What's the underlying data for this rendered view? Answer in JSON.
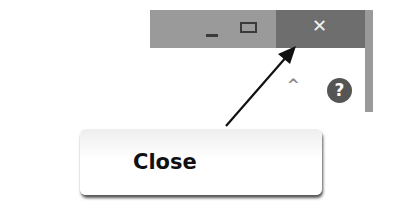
{
  "window_controls": {
    "minimize_glyph": "–",
    "maximize_glyph": "□",
    "close_glyph": "✕"
  },
  "ribbon": {
    "collapse_glyph": "^",
    "help_glyph": "?"
  },
  "callout": {
    "label": "Close"
  },
  "colors": {
    "titlebar": "#9a9a9a",
    "close_button": "#6e6e6e",
    "help_icon": "#555555"
  }
}
